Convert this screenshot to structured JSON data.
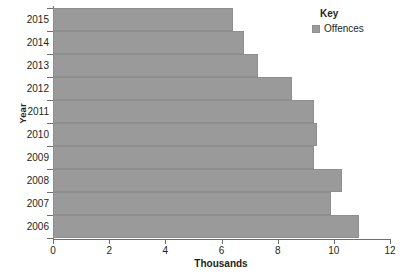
{
  "chart_data": {
    "type": "bar",
    "orientation": "horizontal",
    "title": "",
    "xlabel": "Thousands",
    "ylabel": "Year",
    "categories": [
      "2015",
      "2014",
      "2013",
      "2012",
      "2011",
      "2010",
      "2009",
      "2008",
      "2007",
      "2006"
    ],
    "values": [
      6.4,
      6.8,
      7.3,
      8.5,
      9.3,
      9.4,
      9.3,
      10.3,
      9.9,
      10.9
    ],
    "series": [
      {
        "name": "Offences",
        "values": [
          6.4,
          6.8,
          7.3,
          8.5,
          9.3,
          9.4,
          9.3,
          10.3,
          9.9,
          10.9
        ]
      }
    ],
    "xlim": [
      0,
      12
    ],
    "xticks": [
      0,
      2,
      4,
      6,
      8,
      10,
      12
    ],
    "xtick_labels": [
      "0",
      "2",
      "4",
      "6",
      "8",
      "10",
      "12"
    ],
    "ytick_labels": [
      "2015",
      "2014",
      "2013",
      "2012",
      "2011",
      "2010",
      "2009",
      "2008",
      "2007",
      "2006"
    ],
    "grid": false,
    "legend_position": "top-right",
    "bar_color": "#9a9a9a",
    "axis_color": "#6d6e71",
    "background_color": "#ffffff"
  },
  "legend": {
    "title": "Key",
    "entries": [
      {
        "label": "Offences",
        "color": "#9a9a9a"
      }
    ]
  },
  "axes": {
    "y_title": "Year",
    "x_title": "Thousands"
  }
}
